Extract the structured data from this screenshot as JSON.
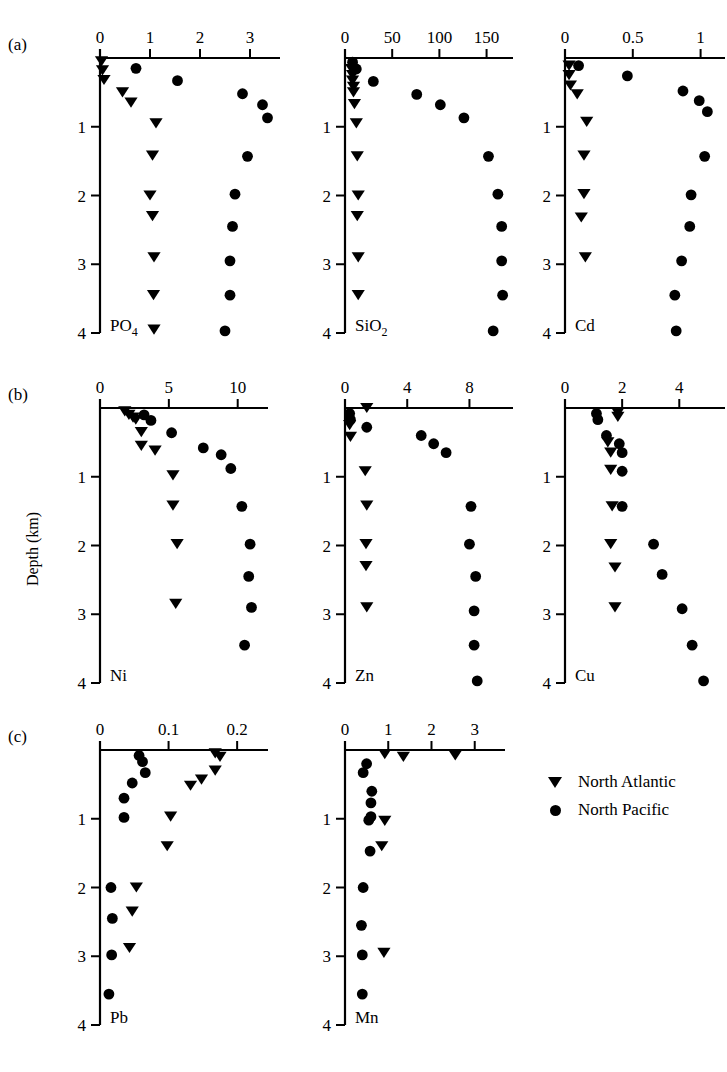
{
  "figure": {
    "y_axis_label": "Depth (km)",
    "depth_ticks": [
      1,
      2,
      3,
      4
    ],
    "depth_range": [
      0,
      4
    ],
    "row_labels": [
      "(a)",
      "(b)",
      "(c)"
    ]
  },
  "legend": {
    "position": "bottom-right",
    "entries": [
      {
        "marker": "triangle-down-icon",
        "label": "North Atlantic"
      },
      {
        "marker": "circle-icon",
        "label": "North Pacific"
      }
    ]
  },
  "chart_data": [
    {
      "type": "scatter",
      "panel": "a1",
      "title": "PO4",
      "species_main": "PO",
      "species_sub": "4",
      "xlabel": "",
      "ylabel": "Depth (km)",
      "xlim": [
        0,
        3.6
      ],
      "ylim": [
        0,
        4
      ],
      "xticks": [
        0,
        1,
        2,
        3
      ],
      "xticklabels": [
        "0",
        "1",
        "2",
        "3"
      ],
      "yticks": [
        1,
        2,
        3,
        4
      ],
      "yticklabels": [
        "1",
        "2",
        "3",
        "4"
      ],
      "grid": false,
      "series": [
        {
          "name": "North Atlantic",
          "marker": "triangle-down",
          "x": [
            0.03,
            0.05,
            0.08,
            0.45,
            0.62,
            1.12,
            1.05,
            1.0,
            1.05,
            1.08,
            1.07,
            1.08
          ],
          "y": [
            0.05,
            0.18,
            0.32,
            0.5,
            0.65,
            0.95,
            1.42,
            2.0,
            2.3,
            2.9,
            3.45,
            3.95
          ]
        },
        {
          "name": "North Pacific",
          "marker": "circle",
          "x": [
            0.72,
            1.55,
            2.85,
            3.25,
            3.35,
            2.95,
            2.7,
            2.65,
            2.6,
            2.6,
            2.5
          ],
          "y": [
            0.15,
            0.33,
            0.52,
            0.68,
            0.87,
            1.43,
            1.98,
            2.45,
            2.95,
            3.45,
            3.97
          ]
        }
      ]
    },
    {
      "type": "scatter",
      "panel": "a2",
      "title": "SiO2",
      "species_main": "SiO",
      "species_sub": "2",
      "xlabel": "",
      "ylabel": "",
      "xlim": [
        0,
        178
      ],
      "ylim": [
        0,
        4
      ],
      "xticks": [
        0,
        50,
        100,
        150
      ],
      "xticklabels": [
        "0",
        "50",
        "100",
        "150"
      ],
      "yticks": [
        1,
        2,
        3,
        4
      ],
      "yticklabels": [
        "1",
        "2",
        "3",
        "4"
      ],
      "grid": false,
      "series": [
        {
          "name": "North Atlantic",
          "marker": "triangle-down",
          "x": [
            7,
            8,
            8,
            9,
            9,
            10,
            12,
            13,
            14,
            13,
            14,
            14
          ],
          "y": [
            0.16,
            0.25,
            0.33,
            0.42,
            0.5,
            0.67,
            0.95,
            1.43,
            2.0,
            2.3,
            2.9,
            3.45
          ]
        },
        {
          "name": "North Pacific",
          "marker": "circle",
          "x": [
            8,
            12,
            30,
            76,
            101,
            126,
            152,
            162,
            166,
            166,
            167,
            157
          ],
          "y": [
            0.06,
            0.16,
            0.34,
            0.53,
            0.68,
            0.87,
            1.43,
            1.98,
            2.45,
            2.95,
            3.45,
            3.97
          ]
        }
      ]
    },
    {
      "type": "scatter",
      "panel": "a3",
      "title": "Cd",
      "species_main": "Cd",
      "species_sub": "",
      "xlabel": "",
      "ylabel": "",
      "xlim": [
        0,
        1.18
      ],
      "ylim": [
        0,
        4
      ],
      "xticks": [
        0,
        0.5,
        1
      ],
      "xticklabels": [
        "0",
        "0.5",
        "1"
      ],
      "yticks": [
        1,
        2,
        3,
        4
      ],
      "yticklabels": [
        "1",
        "2",
        "3",
        "4"
      ],
      "grid": false,
      "series": [
        {
          "name": "North Atlantic",
          "marker": "triangle-down",
          "x": [
            0.03,
            0.03,
            0.04,
            0.09,
            0.16,
            0.14,
            0.14,
            0.12,
            0.15
          ],
          "y": [
            0.11,
            0.25,
            0.4,
            0.53,
            0.93,
            1.42,
            1.98,
            2.32,
            2.9
          ]
        },
        {
          "name": "North Pacific",
          "marker": "circle",
          "x": [
            0.1,
            0.46,
            0.87,
            0.99,
            1.05,
            1.03,
            0.93,
            0.92,
            0.86,
            0.81,
            0.82
          ],
          "y": [
            0.11,
            0.26,
            0.48,
            0.62,
            0.78,
            1.43,
            1.99,
            2.45,
            2.95,
            3.45,
            3.97
          ]
        }
      ]
    },
    {
      "type": "scatter",
      "panel": "b1",
      "title": "Ni",
      "species_main": "Ni",
      "species_sub": "",
      "xlabel": "",
      "ylabel": "Depth (km)",
      "xlim": [
        0,
        12.2
      ],
      "ylim": [
        0,
        4
      ],
      "xticks": [
        0,
        5,
        10
      ],
      "xticklabels": [
        "0",
        "5",
        "10"
      ],
      "yticks": [
        1,
        2,
        3,
        4
      ],
      "yticklabels": [
        "1",
        "2",
        "3",
        "4"
      ],
      "grid": false,
      "series": [
        {
          "name": "North Atlantic",
          "marker": "triangle-down",
          "x": [
            1.8,
            2.1,
            2.4,
            2.6,
            3.0,
            3.0,
            4.0,
            5.3,
            5.3,
            5.6,
            5.5
          ],
          "y": [
            0.05,
            0.1,
            0.14,
            0.17,
            0.35,
            0.55,
            0.62,
            0.98,
            1.42,
            1.98,
            2.85
          ]
        },
        {
          "name": "North Pacific",
          "marker": "circle",
          "x": [
            3.2,
            3.7,
            5.2,
            7.5,
            8.8,
            9.5,
            10.3,
            10.9,
            10.8,
            11.0,
            10.5
          ],
          "y": [
            0.1,
            0.18,
            0.36,
            0.58,
            0.68,
            0.88,
            1.43,
            1.98,
            2.45,
            2.9,
            3.45
          ]
        }
      ]
    },
    {
      "type": "scatter",
      "panel": "b2",
      "title": "Zn",
      "species_main": "Zn",
      "species_sub": "",
      "xlabel": "",
      "ylabel": "",
      "xlim": [
        0,
        10.8
      ],
      "ylim": [
        0,
        4
      ],
      "xticks": [
        0,
        4,
        8
      ],
      "xticklabels": [
        "0",
        "4",
        "8"
      ],
      "yticks": [
        1,
        2,
        3,
        4
      ],
      "yticklabels": [
        "1",
        "2",
        "3",
        "4"
      ],
      "grid": false,
      "series": [
        {
          "name": "North Atlantic",
          "marker": "triangle-down",
          "x": [
            0.3,
            0.35,
            1.3,
            1.4,
            1.35,
            1.35,
            1.4,
            1.4
          ],
          "y": [
            0.25,
            0.42,
            0.92,
            1.42,
            1.98,
            2.3,
            2.9,
            0.0
          ]
        },
        {
          "name": "North Pacific",
          "marker": "circle",
          "x": [
            0.3,
            0.35,
            1.4,
            4.9,
            5.7,
            6.5,
            8.1,
            8.0,
            8.4,
            8.3,
            8.3,
            8.5
          ],
          "y": [
            0.08,
            0.17,
            0.28,
            0.4,
            0.52,
            0.65,
            1.43,
            1.98,
            2.45,
            2.95,
            3.45,
            3.97
          ]
        }
      ]
    },
    {
      "type": "scatter",
      "panel": "b3",
      "title": "Cu",
      "species_main": "Cu",
      "species_sub": "",
      "xlabel": "",
      "ylabel": "",
      "xlim": [
        0,
        5.6
      ],
      "ylim": [
        0,
        4
      ],
      "xticks": [
        0,
        2,
        4
      ],
      "xticklabels": [
        "0",
        "2",
        "4"
      ],
      "yticks": [
        1,
        2,
        3,
        4
      ],
      "yticklabels": [
        "1",
        "2",
        "3",
        "4"
      ],
      "grid": false,
      "series": [
        {
          "name": "North Atlantic",
          "marker": "triangle-down",
          "x": [
            1.85,
            1.85,
            1.5,
            1.6,
            1.6,
            1.65,
            1.6,
            1.75,
            1.75
          ],
          "y": [
            0.07,
            0.13,
            0.5,
            0.65,
            0.9,
            1.43,
            1.98,
            2.32,
            2.9
          ]
        },
        {
          "name": "North Pacific",
          "marker": "circle",
          "x": [
            1.1,
            1.15,
            1.45,
            1.9,
            2.0,
            2.0,
            2.0,
            3.1,
            3.4,
            4.1,
            4.45,
            4.85
          ],
          "y": [
            0.08,
            0.17,
            0.4,
            0.52,
            0.65,
            0.92,
            1.43,
            1.98,
            2.42,
            2.92,
            3.45,
            3.97
          ]
        }
      ]
    },
    {
      "type": "scatter",
      "panel": "c1",
      "title": "Pb",
      "species_main": "Pb",
      "species_sub": "",
      "xlabel": "",
      "ylabel": "",
      "xlim": [
        0,
        0.245
      ],
      "ylim": [
        0,
        4
      ],
      "xticks": [
        0,
        0.1,
        0.2
      ],
      "xticklabels": [
        "0",
        "0.1",
        "0.2"
      ],
      "yticks": [
        1,
        2,
        3,
        4
      ],
      "yticklabels": [
        "1",
        "2",
        "3",
        "4"
      ],
      "grid": false,
      "series": [
        {
          "name": "North Atlantic",
          "marker": "triangle-down",
          "x": [
            0.168,
            0.175,
            0.168,
            0.148,
            0.132,
            0.103,
            0.098,
            0.053,
            0.047,
            0.043
          ],
          "y": [
            0.05,
            0.1,
            0.3,
            0.43,
            0.52,
            0.97,
            1.4,
            2.0,
            2.35,
            2.88
          ]
        },
        {
          "name": "North Pacific",
          "marker": "circle",
          "x": [
            0.057,
            0.062,
            0.066,
            0.047,
            0.035,
            0.035,
            0.016,
            0.018,
            0.017,
            0.013
          ],
          "y": [
            0.08,
            0.17,
            0.33,
            0.48,
            0.7,
            0.98,
            2.0,
            2.45,
            2.98,
            3.55
          ]
        }
      ]
    },
    {
      "type": "scatter",
      "panel": "c2",
      "title": "Mn",
      "species_main": "Mn",
      "species_sub": "",
      "xlabel": "",
      "ylabel": "",
      "xlim": [
        0,
        3.7
      ],
      "ylim": [
        0,
        4
      ],
      "xticks": [
        0,
        1,
        2,
        3
      ],
      "xticklabels": [
        "0",
        "1",
        "2",
        "3"
      ],
      "yticks": [
        1,
        2,
        3,
        4
      ],
      "yticklabels": [
        "1",
        "2",
        "3",
        "4"
      ],
      "grid": false,
      "series": [
        {
          "name": "North Atlantic",
          "marker": "triangle-down",
          "x": [
            0.92,
            1.35,
            2.55,
            0.92,
            0.85,
            0.9
          ],
          "y": [
            0.06,
            0.1,
            0.08,
            1.03,
            1.4,
            2.95
          ]
        },
        {
          "name": "North Pacific",
          "marker": "circle",
          "x": [
            0.5,
            0.42,
            0.62,
            0.6,
            0.6,
            0.55,
            0.58,
            0.42,
            0.38,
            0.4,
            0.4
          ],
          "y": [
            0.2,
            0.33,
            0.6,
            0.77,
            0.97,
            1.02,
            1.47,
            2.0,
            2.55,
            2.98,
            3.55
          ]
        }
      ]
    }
  ]
}
